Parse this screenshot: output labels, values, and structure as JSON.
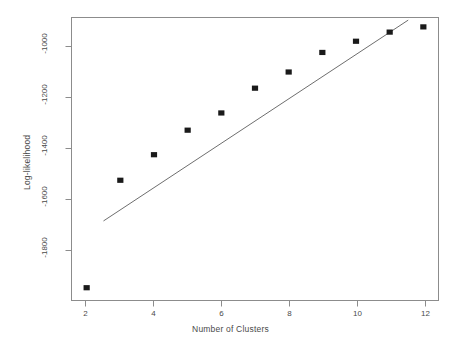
{
  "chart_data": {
    "type": "scatter",
    "title": "",
    "subtitle": "",
    "xlabel": "Number of Clusters",
    "ylabel": "Log-likelihood",
    "xlim": [
      1.55,
      12.45
    ],
    "ylim": [
      -1990,
      -905
    ],
    "xticks": [
      2,
      4,
      6,
      8,
      10,
      12
    ],
    "xtick_labels": [
      "2",
      "4",
      "6",
      "8",
      "10",
      "12"
    ],
    "yticks": [
      -1000,
      -1200,
      -1400,
      -1600,
      -1800
    ],
    "ytick_labels": [
      "-1000",
      "-1200",
      "-1400",
      "-1600",
      "-1800"
    ],
    "grid": false,
    "legend": null,
    "marker": "filled-square",
    "point_color": "#1a1a1a",
    "line_color": "#6e6e6e",
    "frame_color": "#8c8c8c",
    "x": [
      2,
      3,
      4,
      5,
      6,
      7,
      8,
      9,
      10,
      11,
      12
    ],
    "values": [
      -1941,
      -1529,
      -1431,
      -1337,
      -1271,
      -1176,
      -1114,
      -1039,
      -996,
      -961,
      -941
    ],
    "series": [
      {
        "name": "Log-likelihood by cluster count",
        "x": [
          2,
          3,
          4,
          5,
          6,
          7,
          8,
          9,
          10,
          11,
          12
        ],
        "values": [
          -1941,
          -1529,
          -1431,
          -1337,
          -1271,
          -1176,
          -1114,
          -1039,
          -996,
          -961,
          -941
        ]
      }
    ],
    "reference_line": {
      "name": "fitted line",
      "x": [
        2.5,
        11.55
      ],
      "values": [
        -1685,
        -915
      ]
    },
    "annotations": []
  },
  "axes": {
    "x_title": "Number of Clusters",
    "y_title": "Log-likelihood"
  }
}
